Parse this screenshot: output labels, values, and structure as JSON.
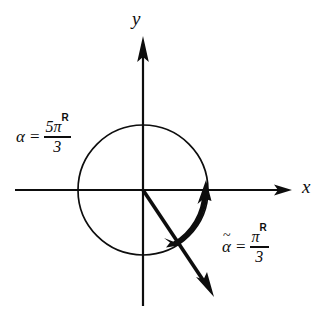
{
  "figure": {
    "background_color": "#ffffff",
    "stroke_color": "#0d0d0d",
    "axes": {
      "x_label": "x",
      "y_label": "y",
      "origin": {
        "x": 143,
        "y": 190
      },
      "x_axis": {
        "start_x": 15,
        "end_x": 292,
        "arrow": "right"
      },
      "y_axis": {
        "start_y": 38,
        "end_y": 306,
        "arrow": "up"
      }
    },
    "circle": {
      "name": "unit-circle",
      "center_x": 143,
      "center_y": 190,
      "radius": 65,
      "stroke_width": 1.6
    },
    "terminal_ray": {
      "name": "terminal-side-ray",
      "angle_degrees": -60,
      "from_x": 143,
      "from_y": 190,
      "to_x": 213,
      "to_y": 296,
      "arrow": "down-right",
      "stroke_width": 3.4
    },
    "circle_direction_arrow": {
      "name": "clockwise-direction-arrowhead",
      "x": 179,
      "y": 243,
      "direction": "clockwise"
    },
    "arc_arrow": {
      "name": "angle-arc-arrow",
      "start_angle_degrees": -60,
      "end_angle_degrees": 0,
      "radius": 62,
      "direction": "counterclockwise",
      "arrow": "up",
      "stroke_width": 5
    },
    "labels": {
      "alpha": {
        "name": "alpha-label",
        "symbol": "α",
        "equals": "=",
        "numerator": "5π",
        "superscript": "R",
        "denominator": "3",
        "full_text": "α = 5πᴿ/3",
        "x": 16,
        "y": 118
      },
      "alpha_tilde": {
        "name": "alpha-tilde-label",
        "symbol": "α",
        "tilde": "~",
        "equals": "=",
        "numerator": "π",
        "superscript": "R",
        "denominator": "3",
        "full_text": "α̃ = πᴿ/3",
        "x": 222,
        "y": 228
      }
    }
  }
}
